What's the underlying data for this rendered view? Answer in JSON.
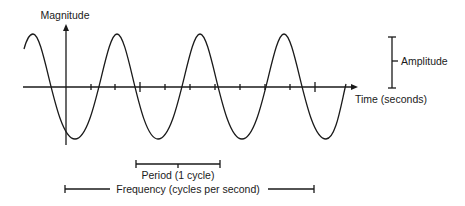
{
  "diagram": {
    "labels": {
      "y_axis": "Magnitude",
      "x_axis": "Time (seconds)",
      "amplitude": "Amplitude",
      "period": "Period (1 cycle)",
      "frequency": "Frequency (cycles per second)"
    },
    "wave": {
      "shape": "sine",
      "cycles_visible": 4,
      "color": "#1a1a1a"
    },
    "axis": {
      "tick_count": 10,
      "major_ticks": 2
    }
  }
}
